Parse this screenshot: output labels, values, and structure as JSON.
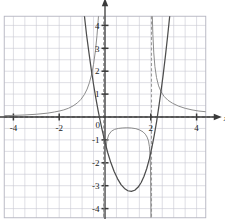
{
  "chart_data": {
    "type": "line",
    "title": "",
    "xlabel": "x",
    "ylabel": "y",
    "xlim": [
      -4.4,
      4.4
    ],
    "ylim": [
      -4.4,
      4.4
    ],
    "grid": true,
    "grid_step": 0.5,
    "legend": "none",
    "x_ticks": [
      -4,
      -2,
      0,
      2,
      4
    ],
    "x_tick_labels": [
      "-4",
      "-2",
      "0",
      "2",
      "4"
    ],
    "y_ticks": [
      4,
      3,
      2,
      1,
      -1,
      -2,
      -3,
      -4
    ],
    "y_tick_labels": [
      "4",
      "3",
      "2",
      "1",
      "-1",
      "-2",
      "-3",
      "-4"
    ],
    "series": [
      {
        "name": "rational-curve-left-branch",
        "color": "#8c8c8c",
        "style": "solid",
        "points": [
          [
            -4.4,
            0.06
          ],
          [
            -4.0,
            0.07
          ],
          [
            -3.5,
            0.09
          ],
          [
            -3.0,
            0.12
          ],
          [
            -2.5,
            0.17
          ],
          [
            -2.2,
            0.22
          ],
          [
            -2.0,
            0.26
          ],
          [
            -1.8,
            0.31
          ],
          [
            -1.6,
            0.38
          ],
          [
            -1.4,
            0.48
          ],
          [
            -1.2,
            0.62
          ],
          [
            -1.05,
            0.77
          ],
          [
            -0.9,
            0.98
          ],
          [
            -0.78,
            1.22
          ],
          [
            -0.68,
            1.5
          ],
          [
            -0.58,
            1.88
          ],
          [
            -0.5,
            2.3
          ],
          [
            -0.42,
            2.88
          ],
          [
            -0.35,
            3.55
          ],
          [
            -0.3,
            4.2
          ],
          [
            -0.27,
            4.6
          ]
        ]
      },
      {
        "name": "rational-curve-middle-branch",
        "color": "#8c8c8c",
        "style": "solid",
        "points": [
          [
            -0.05,
            -4.6
          ],
          [
            -0.02,
            -2.6
          ],
          [
            0.02,
            -1.6
          ],
          [
            0.08,
            -1.05
          ],
          [
            0.16,
            -0.78
          ],
          [
            0.28,
            -0.62
          ],
          [
            0.42,
            -0.54
          ],
          [
            0.58,
            -0.5
          ],
          [
            0.75,
            -0.48
          ],
          [
            0.95,
            -0.47
          ],
          [
            1.15,
            -0.48
          ],
          [
            1.35,
            -0.51
          ],
          [
            1.52,
            -0.57
          ],
          [
            1.66,
            -0.65
          ],
          [
            1.76,
            -0.75
          ],
          [
            1.84,
            -0.88
          ],
          [
            1.9,
            -1.05
          ],
          [
            1.94,
            -1.3
          ],
          [
            1.97,
            -1.7
          ],
          [
            1.99,
            -2.4
          ],
          [
            2.0,
            -3.4
          ],
          [
            2.01,
            -4.6
          ]
        ]
      },
      {
        "name": "rational-curve-right-branch",
        "color": "#8c8c8c",
        "style": "solid",
        "points": [
          [
            2.06,
            4.6
          ],
          [
            2.09,
            3.6
          ],
          [
            2.13,
            2.8
          ],
          [
            2.18,
            2.2
          ],
          [
            2.25,
            1.72
          ],
          [
            2.34,
            1.36
          ],
          [
            2.45,
            1.1
          ],
          [
            2.58,
            0.9
          ],
          [
            2.75,
            0.73
          ],
          [
            2.95,
            0.6
          ],
          [
            3.2,
            0.48
          ],
          [
            3.5,
            0.38
          ],
          [
            3.8,
            0.31
          ],
          [
            4.1,
            0.26
          ],
          [
            4.4,
            0.23
          ]
        ]
      },
      {
        "name": "polynomial-curve",
        "color": "#4d4d4d",
        "style": "solid",
        "points": [
          [
            -0.92,
            4.6
          ],
          [
            -0.8,
            3.55
          ],
          [
            -0.7,
            2.8
          ],
          [
            -0.6,
            2.08
          ],
          [
            -0.5,
            1.42
          ],
          [
            -0.4,
            0.82
          ],
          [
            -0.3,
            0.28
          ],
          [
            -0.22,
            -0.12
          ],
          [
            -0.12,
            -0.58
          ],
          [
            0.0,
            -1.1
          ],
          [
            0.12,
            -1.56
          ],
          [
            0.25,
            -1.98
          ],
          [
            0.4,
            -2.38
          ],
          [
            0.55,
            -2.7
          ],
          [
            0.7,
            -2.95
          ],
          [
            0.85,
            -3.12
          ],
          [
            1.0,
            -3.22
          ],
          [
            1.15,
            -3.25
          ],
          [
            1.3,
            -3.2
          ],
          [
            1.45,
            -3.06
          ],
          [
            1.58,
            -2.86
          ],
          [
            1.7,
            -2.6
          ],
          [
            1.82,
            -2.26
          ],
          [
            1.94,
            -1.82
          ],
          [
            2.05,
            -1.32
          ],
          [
            2.15,
            -0.8
          ],
          [
            2.25,
            -0.22
          ],
          [
            2.34,
            0.38
          ],
          [
            2.44,
            1.08
          ],
          [
            2.54,
            1.84
          ],
          [
            2.64,
            2.68
          ],
          [
            2.74,
            3.58
          ],
          [
            2.83,
            4.45
          ],
          [
            2.86,
            4.75
          ]
        ]
      }
    ],
    "asymptotes": [
      {
        "name": "vertical-asymptote-left",
        "type": "vertical",
        "value": -0.06,
        "style": "dashed",
        "color": "#9b9b9b"
      },
      {
        "name": "vertical-asymptote-right",
        "type": "vertical",
        "value": 2.03,
        "style": "dashed",
        "color": "#9b9b9b"
      },
      {
        "name": "horizontal-asymptote",
        "type": "horizontal",
        "value": 0,
        "style": "dashed",
        "color": "#6b6b6b"
      }
    ],
    "colors": {
      "grid": "#c8c8d2",
      "axis": "#3a3a3a",
      "frame": "#b4b4c0",
      "rational": "#8c8c8c",
      "polynomial": "#4d4d4d",
      "asymptote": "#9b9b9b",
      "text": "#1a1a1a"
    }
  }
}
